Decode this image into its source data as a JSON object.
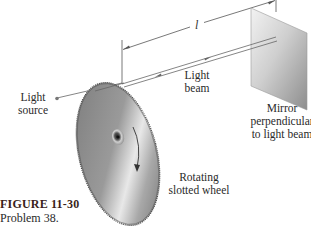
{
  "figure": {
    "caption_title": "FIGURE 11-30",
    "caption_text": "Problem 38."
  },
  "labels": {
    "distance": "l",
    "light_beam_line1": "Light",
    "light_beam_line2": "beam",
    "light_source_line1": "Light",
    "light_source_line2": "source",
    "mirror_line1": "Mirror",
    "mirror_line2": "perpendicular",
    "mirror_line3": "to light beam",
    "wheel_line1": "Rotating",
    "wheel_line2": "slotted wheel"
  },
  "colors": {
    "background": "#ffffff",
    "line": "#555555",
    "wheel_dark": "#6e6e6e",
    "wheel_light": "#e6e6e6",
    "mirror_dark": "#8a8a8a",
    "mirror_light": "#f0f0f0",
    "caption_title": "#3a1f1a"
  }
}
